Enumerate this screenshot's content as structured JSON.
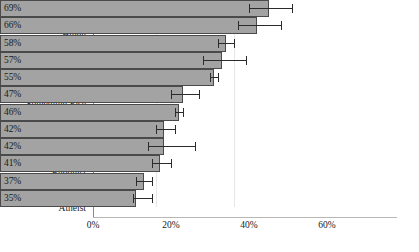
{
  "chart_data": {
    "type": "bar",
    "orientation": "horizontal",
    "title": "",
    "xlabel": "",
    "ylabel": "",
    "xlim": [
      0,
      78
    ],
    "xticks": [
      "0%",
      "20%",
      "40%",
      "60%"
    ],
    "xtick_values": [
      0,
      20,
      40,
      60
    ],
    "grid": true,
    "grid_axis": "x",
    "legend": "none",
    "bar_color": "#a3a3a3",
    "bar_edge_color": "#4a4a4a",
    "error_bar_color": "#2b2b2b",
    "categories": [
      "Mormon",
      "Hindu",
      "Catholic",
      "Muslim",
      "Protestant",
      "Something Else",
      "Nothing in Particular",
      "Orthodox",
      "Jewish",
      "Buddhist",
      "Agnostic",
      "Atheist"
    ],
    "values": [
      69,
      66,
      58,
      57,
      55,
      47,
      46,
      42,
      42,
      41,
      37,
      35
    ],
    "data_labels": [
      "69%",
      "66%",
      "58%",
      "57%",
      "55%",
      "47%",
      "46%",
      "42%",
      "42%",
      "41%",
      "37%",
      "35%"
    ],
    "error_low": [
      64,
      61,
      56,
      52,
      54,
      44,
      45,
      40,
      38,
      39,
      35,
      34
    ],
    "error_high": [
      75,
      72,
      60,
      63,
      56,
      51,
      47,
      45,
      50,
      44,
      39,
      39
    ]
  }
}
